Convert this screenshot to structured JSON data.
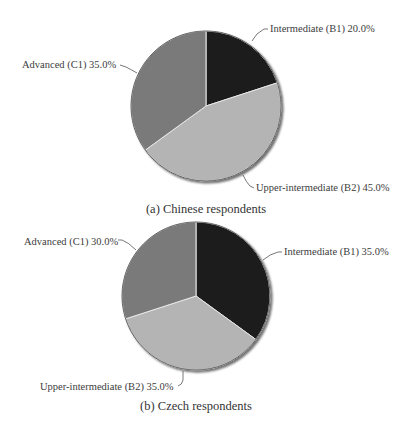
{
  "chart_data": [
    {
      "type": "pie",
      "title": "(a) Chinese respondents",
      "categories": [
        "Intermediate (B1)",
        "Upper-intermediate (B2)",
        "Advanced (C1)"
      ],
      "values": [
        20.0,
        45.0,
        35.0
      ],
      "labels": [
        "Intermediate (B1) 20.0%",
        "Upper-intermediate (B2) 45.0%",
        "Advanced (C1) 35.0%"
      ],
      "colors": [
        "#1e1e1e",
        "#b4b4b4",
        "#7a7a7a"
      ],
      "start_angle": "12 o'clock, clockwise"
    },
    {
      "type": "pie",
      "title": "(b) Czech respondents",
      "categories": [
        "Intermediate (B1)",
        "Upper-intermediate (B2)",
        "Advanced (C1)"
      ],
      "values": [
        35.0,
        35.0,
        30.0
      ],
      "labels": [
        "Intermediate (B1) 35.0%",
        "Upper-intermediate (B2) 35.0%",
        "Advanced (C1) 30.0%"
      ],
      "colors": [
        "#1e1e1e",
        "#b4b4b4",
        "#7a7a7a"
      ],
      "start_angle": "12 o'clock, clockwise"
    }
  ],
  "charts": {
    "a": {
      "caption": "(a) Chinese respondents",
      "label_b1": "Intermediate (B1) 20.0%",
      "label_b2": "Upper-intermediate (B2) 45.0%",
      "label_c1": "Advanced (C1) 35.0%"
    },
    "b": {
      "caption": "(b) Czech respondents",
      "label_b1": "Intermediate (B1) 35.0%",
      "label_b2": "Upper-intermediate (B2) 35.0%",
      "label_c1": "Advanced (C1) 30.0%"
    }
  }
}
